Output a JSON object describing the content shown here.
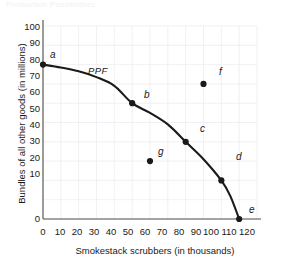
{
  "figure": {
    "top_strip_text": "Production Possibilities",
    "curve_label": "PPF"
  },
  "chart_data": {
    "type": "line",
    "title": "",
    "xlabel": "Smokestack scrubbers (in thousands)",
    "ylabel": "Bundles of all other goods (in millions)",
    "xlim": [
      0,
      120
    ],
    "ylim": [
      0,
      100
    ],
    "xticks": [
      0,
      10,
      20,
      30,
      40,
      50,
      60,
      70,
      80,
      90,
      100,
      110,
      120
    ],
    "yticks": [
      0,
      10,
      20,
      30,
      40,
      50,
      60,
      70,
      80,
      90,
      100
    ],
    "grid": true,
    "grid_color": "#ededf2",
    "legend": "none",
    "series": [
      {
        "name": "PPF",
        "type": "line",
        "color": "#1a1a1a",
        "x": [
          0,
          10,
          20,
          30,
          40,
          50,
          60,
          70,
          80,
          90,
          100,
          105,
          110
        ],
        "y": [
          80,
          78.5,
          76.5,
          73.5,
          69,
          60,
          55,
          49,
          40,
          31,
          20,
          12,
          0
        ]
      },
      {
        "name": "labeled points",
        "type": "scatter",
        "color": "#1a1a1a",
        "points": [
          {
            "label": "a",
            "x": 0,
            "y": 80,
            "on_curve": true
          },
          {
            "label": "b",
            "x": 50,
            "y": 60,
            "on_curve": true
          },
          {
            "label": "c",
            "x": 80,
            "y": 40,
            "on_curve": true
          },
          {
            "label": "d",
            "x": 100,
            "y": 20,
            "on_curve": true
          },
          {
            "label": "e",
            "x": 110,
            "y": 0,
            "on_curve": true
          },
          {
            "label": "f",
            "x": 90,
            "y": 70,
            "on_curve": false
          },
          {
            "label": "g",
            "x": 60,
            "y": 30,
            "on_curve": false
          }
        ]
      }
    ]
  },
  "axis": {
    "y": {
      "t0": "0",
      "t1": "10",
      "t2": "20",
      "t3": "30",
      "t4": "40",
      "t5": "50",
      "t6": "60",
      "t7": "70",
      "t8": "80",
      "t9": "90",
      "t10": "100"
    },
    "x": {
      "t0": "0",
      "t1": "10",
      "t2": "20",
      "t3": "30",
      "t4": "40",
      "t5": "50",
      "t6": "60",
      "t7": "70",
      "t8": "80",
      "t9": "90",
      "t10": "100",
      "t11": "110",
      "t12": "120"
    }
  },
  "points": {
    "a": "a",
    "b": "b",
    "c": "c",
    "d": "d",
    "e": "e",
    "f": "f",
    "g": "g"
  }
}
